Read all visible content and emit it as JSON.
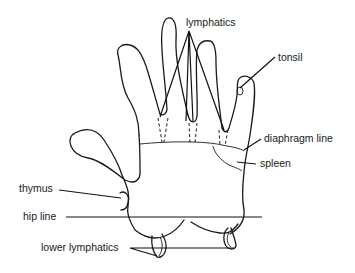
{
  "figure": {
    "labels": {
      "lymphatics": "lymphatics",
      "tonsil": "tonsil",
      "diaphragm_line": "diaphragm line",
      "spleen": "spleen",
      "thymus": "thymus",
      "hip_line": "hip line",
      "lower_lymphatics": "lower lymphatics"
    },
    "colors": {
      "line": "#1a1a1a",
      "background": "#ffffff"
    }
  }
}
